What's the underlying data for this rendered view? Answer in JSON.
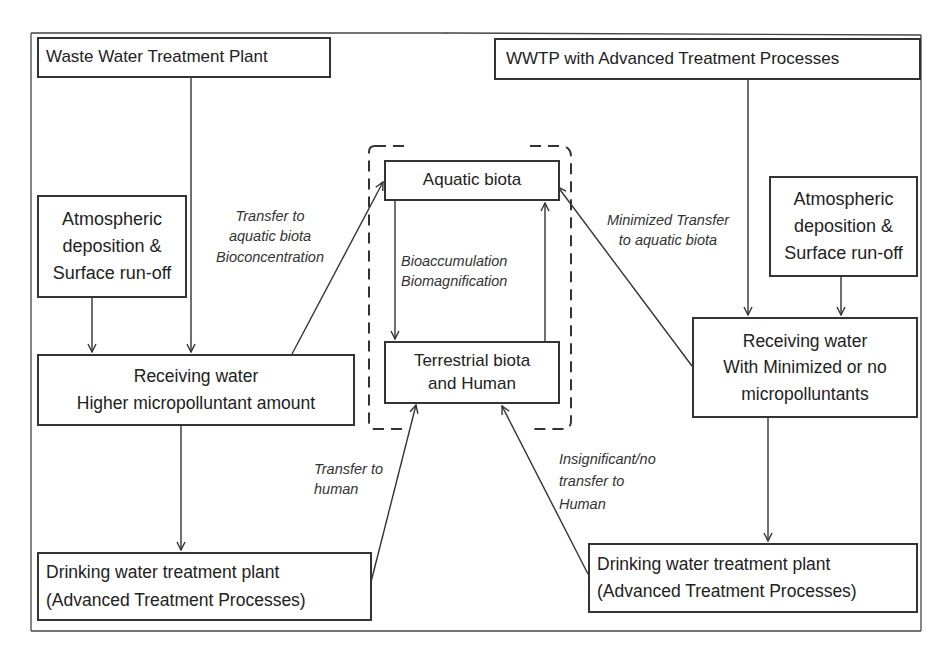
{
  "diagram": {
    "left_column": {
      "wwtp": {
        "title": "Waste Water Treatment Plant"
      },
      "atmospheric": {
        "lines": [
          "Atmospheric",
          "deposition &",
          "Surface run-off"
        ]
      },
      "receiving_water": {
        "lines": [
          "Receiving water",
          "Higher micropolluntant amount"
        ]
      },
      "drinking_water": {
        "lines": [
          "Drinking water treatment plant",
          "(Advanced Treatment Processes)"
        ]
      }
    },
    "center_column": {
      "aquatic_biota": {
        "title": "Aquatic biota"
      },
      "terrestrial_biota": {
        "lines": [
          "Terrestrial biota",
          "and Human"
        ]
      },
      "bio_label": {
        "lines": [
          "Bioaccumulation",
          "Biomagnification"
        ]
      }
    },
    "right_column": {
      "wwtp_advanced": {
        "title": "WWTP with Advanced Treatment Processes"
      },
      "atmospheric": {
        "lines": [
          "Atmospheric",
          "deposition &",
          "Surface run-off"
        ]
      },
      "receiving_water": {
        "lines": [
          "Receiving water",
          "With Minimized or no",
          "micropolluntants"
        ]
      },
      "drinking_water": {
        "lines": [
          "Drinking water treatment plant",
          "(Advanced Treatment Processes)"
        ]
      }
    },
    "edge_labels": {
      "transfer_aquatic": {
        "lines": [
          "Transfer to",
          "aquatic biota",
          "Bioconcentration"
        ]
      },
      "minimized_transfer": {
        "lines": [
          "Minimized Transfer",
          "to aquatic biota"
        ]
      },
      "transfer_human": {
        "lines": [
          "Transfer to",
          "human"
        ]
      },
      "insignificant_transfer": {
        "lines": [
          "Insignificant/no",
          "transfer to",
          "Human"
        ]
      }
    },
    "colors": {
      "stroke": "#333333",
      "text": "#222222",
      "background": "#ffffff"
    }
  }
}
